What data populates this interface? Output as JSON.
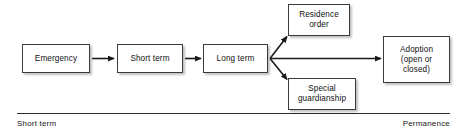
{
  "figure": {
    "type": "flow-diagram",
    "title": "",
    "nodes": [
      {
        "id": "emergency",
        "label": "Emergency",
        "lines": [
          "Emergency"
        ]
      },
      {
        "id": "short_term",
        "label": "Short term",
        "lines": [
          "Short term"
        ]
      },
      {
        "id": "long_term",
        "label": "Long term",
        "lines": [
          "Long term"
        ]
      },
      {
        "id": "residence",
        "label": "Residence order",
        "lines": [
          "Residence",
          "order"
        ]
      },
      {
        "id": "special",
        "label": "Special guardianship",
        "lines": [
          "Special",
          "guardianship"
        ]
      },
      {
        "id": "adoption",
        "label": "Adoption (open or closed)",
        "lines": [
          "Adoption",
          "(open or",
          "closed)"
        ]
      }
    ],
    "edges": [
      {
        "from": "emergency",
        "to": "short_term",
        "style": "solid-arrow"
      },
      {
        "from": "short_term",
        "to": "long_term",
        "style": "solid-arrow"
      },
      {
        "from": "long_term",
        "to": "residence",
        "style": "solid-arrow"
      },
      {
        "from": "long_term",
        "to": "adoption",
        "style": "solid-arrow"
      },
      {
        "from": "long_term",
        "to": "special",
        "style": "solid-arrow"
      }
    ],
    "axis": {
      "left_label": "Short term",
      "right_label": "Permanence"
    },
    "colors": {
      "box_border": "#3a3a3a",
      "box_fill": "#ffffff",
      "text": "#111111",
      "arrow": "#1a1a1a",
      "axis": "#2b2b2b",
      "background": "#ffffff"
    }
  }
}
